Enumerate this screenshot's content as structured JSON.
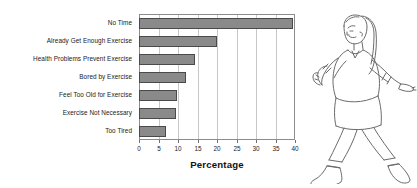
{
  "chart_data": {
    "type": "bar",
    "orientation": "horizontal",
    "title": "",
    "xlabel": "Percentage",
    "ylabel": "",
    "xlim": [
      0,
      40
    ],
    "xticks": [
      0,
      5,
      10,
      15,
      20,
      25,
      30,
      35,
      40
    ],
    "xtick_labels": [
      "0",
      "5",
      "10",
      "15",
      "20",
      "25",
      "30",
      "35",
      "40"
    ],
    "grid": true,
    "legend": false,
    "categories": [
      "No Time",
      "Already Get Enough Exercise",
      "Health Problems Prevent Exercise",
      "Bored by Exercise",
      "Feel Too Old for Exercise",
      "Exercise Not Necessary",
      "Too Tired"
    ],
    "values": [
      39.5,
      20.0,
      14.3,
      12.0,
      9.8,
      9.4,
      6.8
    ],
    "bar_fill_color": "#8a8a8a",
    "bar_edge_color": "#4a4a4a",
    "grid_color": "#c8c8c8",
    "axis_color": "#8c8c8c"
  },
  "illustration": {
    "name": "walking-woman-line-art",
    "description": "Line drawing of a woman walking to the right"
  }
}
